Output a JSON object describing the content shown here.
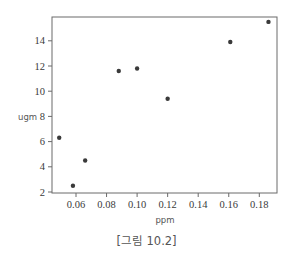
{
  "chart_data": {
    "type": "scatter",
    "title": "",
    "xlabel": "ppm",
    "ylabel": "ugm",
    "xlim": [
      0.045,
      0.192
    ],
    "ylim": [
      1.9,
      15.9
    ],
    "xticks": [
      0.06,
      0.08,
      0.1,
      0.12,
      0.14,
      0.16,
      0.18
    ],
    "xtick_labels": [
      "0.06",
      "0.08",
      "0.10",
      "0.12",
      "0.14",
      "0.16",
      "0.18"
    ],
    "yticks": [
      2,
      4,
      6,
      8,
      10,
      12,
      14
    ],
    "ytick_labels": [
      "2",
      "4",
      "6",
      "8",
      "10",
      "12",
      "14"
    ],
    "grid": false,
    "legend": null,
    "points": [
      {
        "x": 0.049,
        "y": 6.3
      },
      {
        "x": 0.058,
        "y": 2.5
      },
      {
        "x": 0.066,
        "y": 4.5
      },
      {
        "x": 0.088,
        "y": 11.6
      },
      {
        "x": 0.1,
        "y": 11.8
      },
      {
        "x": 0.12,
        "y": 9.4
      },
      {
        "x": 0.161,
        "y": 13.9
      },
      {
        "x": 0.186,
        "y": 15.5
      }
    ],
    "marker_color": "#3a3a3a",
    "axis_color": "#6a6a6a"
  },
  "caption": "[그림 10.2]"
}
